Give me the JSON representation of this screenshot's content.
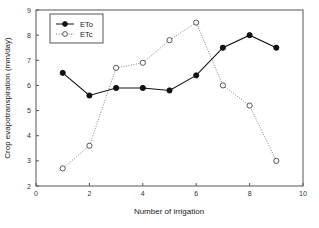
{
  "chart_data": {
    "type": "line",
    "title": "",
    "xlabel": "Number of irrigation",
    "ylabel": "Crop evapotranspiration (mm/day)",
    "xlim": [
      0,
      10
    ],
    "ylim": [
      2,
      9
    ],
    "xticks": [
      0,
      2,
      4,
      6,
      8,
      10
    ],
    "yticks": [
      2,
      3,
      4,
      5,
      6,
      7,
      8,
      9
    ],
    "grid": false,
    "legend_position": "upper-left",
    "x": [
      1,
      2,
      3,
      4,
      5,
      6,
      7,
      8,
      9
    ],
    "series": [
      {
        "name": "ETo",
        "marker": "filled-circle",
        "line": "solid",
        "color": "#111111",
        "values": [
          6.5,
          5.6,
          5.9,
          5.9,
          5.8,
          6.4,
          7.5,
          8.0,
          7.5
        ]
      },
      {
        "name": "ETc",
        "marker": "open-circle",
        "line": "dotted",
        "color": "#777777",
        "values": [
          2.7,
          3.6,
          6.7,
          6.9,
          7.8,
          8.5,
          6.0,
          5.2,
          3.0
        ]
      }
    ]
  }
}
